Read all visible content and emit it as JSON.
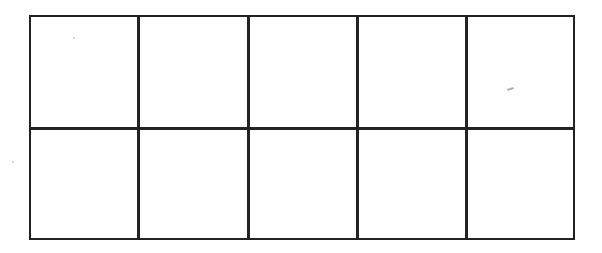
{
  "diagram": {
    "type": "ten-frame grid",
    "rows": 2,
    "columns": 5,
    "line_color": "#222222",
    "background": "#ffffff",
    "cells": [
      {
        "row": 1,
        "col": 1,
        "content": ""
      },
      {
        "row": 1,
        "col": 2,
        "content": ""
      },
      {
        "row": 1,
        "col": 3,
        "content": ""
      },
      {
        "row": 1,
        "col": 4,
        "content": ""
      },
      {
        "row": 1,
        "col": 5,
        "content": ""
      },
      {
        "row": 2,
        "col": 1,
        "content": ""
      },
      {
        "row": 2,
        "col": 2,
        "content": ""
      },
      {
        "row": 2,
        "col": 3,
        "content": ""
      },
      {
        "row": 2,
        "col": 4,
        "content": ""
      },
      {
        "row": 2,
        "col": 5,
        "content": ""
      }
    ]
  }
}
